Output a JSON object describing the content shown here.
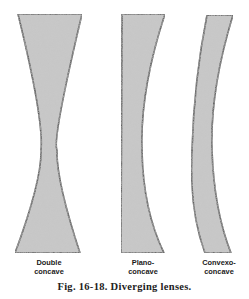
{
  "figure": {
    "caption": "Fig. 16-18. Diverging lenses.",
    "colors": {
      "lens_fill": "#c9c9c9",
      "lens_outline": "#111111",
      "text": "#1a1a1a",
      "background": "#ffffff"
    },
    "lenses": [
      {
        "id": "double-concave",
        "label_line1": "Double",
        "label_line2": "concave"
      },
      {
        "id": "plano-concave",
        "label_line1": "Plano-",
        "label_line2": "concave"
      },
      {
        "id": "convexo-concave",
        "label_line1": "Convexo-",
        "label_line2": "concave"
      }
    ]
  }
}
